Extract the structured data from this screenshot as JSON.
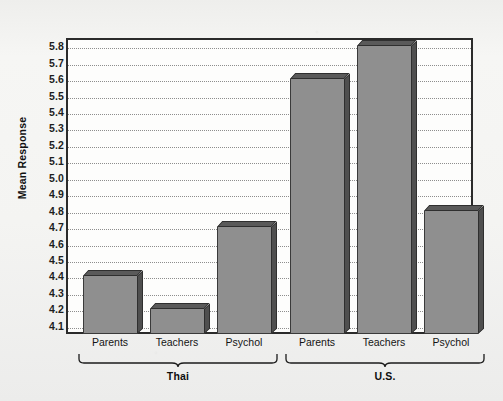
{
  "chart_data": {
    "type": "bar",
    "title": "",
    "xlabel": "",
    "ylabel": "Mean Response",
    "ylim": [
      4.05,
      5.85
    ],
    "grid": true,
    "legend_position": "none",
    "ytick_labels": [
      "5.8",
      "5.7",
      "5.6",
      "5.5",
      "5.4",
      "5.3",
      "5.2",
      "5.1",
      "5.0",
      "4.9",
      "4.8",
      "4.7",
      "4.6",
      "4.5",
      "4.4",
      "4.3",
      "4.2",
      "4.1"
    ],
    "ytick_values": [
      5.8,
      5.7,
      5.6,
      5.5,
      5.4,
      5.3,
      5.2,
      5.1,
      5.0,
      4.9,
      4.8,
      4.7,
      4.6,
      4.5,
      4.4,
      4.3,
      4.2,
      4.1
    ],
    "categories": [
      "Parents",
      "Teachers",
      "Psychol"
    ],
    "groups": [
      {
        "name": "Thai",
        "categories": [
          "Parents",
          "Teachers",
          "Psychol"
        ],
        "values": [
          4.4,
          4.2,
          4.7
        ]
      },
      {
        "name": "U.S.",
        "categories": [
          "Parents",
          "Teachers",
          "Psychol"
        ],
        "values": [
          5.6,
          5.8,
          4.8
        ]
      }
    ],
    "bars": [
      {
        "group": "Thai",
        "category": "Parents",
        "value": 4.4
      },
      {
        "group": "Thai",
        "category": "Teachers",
        "value": 4.2
      },
      {
        "group": "Thai",
        "category": "Psychol",
        "value": 4.7
      },
      {
        "group": "U.S.",
        "category": "Parents",
        "value": 5.6
      },
      {
        "group": "U.S.",
        "category": "Teachers",
        "value": 5.8
      },
      {
        "group": "U.S.",
        "category": "Psychol",
        "value": 4.8
      }
    ],
    "colors": {
      "bar_front": "#8f8f8f",
      "bar_top": "#5a5a5a",
      "bar_side": "#4f4f4f",
      "bar_outline": "#2f2f2f",
      "plot_background": "#fdfdfc",
      "frame": "#2b2b2b",
      "gridline": "#8d8d8d",
      "page_background": "#f2f2f0",
      "text": "#141414"
    }
  }
}
